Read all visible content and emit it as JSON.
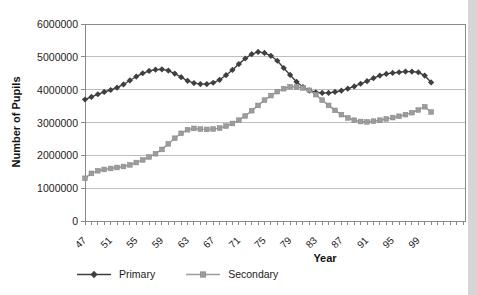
{
  "chart_data": {
    "type": "line",
    "title": "",
    "xlabel": "Year",
    "ylabel": "Number of Pupils",
    "ylim": [
      0,
      6000000
    ],
    "y_tick_interval": 1000000,
    "y_tick_labels": [
      "6000000",
      "5000000",
      "4000000",
      "3000000",
      "2000000",
      "1000000",
      "0"
    ],
    "x_tick_labels": [
      "47",
      "51",
      "55",
      "59",
      "63",
      "67",
      "71",
      "75",
      "79",
      "83",
      "87",
      "91",
      "95",
      "99"
    ],
    "x_label_every": 4,
    "grid": "horizontal",
    "legend_position": "bottom",
    "x": [
      1947,
      1948,
      1949,
      1950,
      1951,
      1952,
      1953,
      1954,
      1955,
      1956,
      1957,
      1958,
      1959,
      1960,
      1961,
      1962,
      1963,
      1964,
      1965,
      1966,
      1967,
      1968,
      1969,
      1970,
      1971,
      1972,
      1973,
      1974,
      1975,
      1976,
      1977,
      1978,
      1979,
      1980,
      1981,
      1982,
      1983,
      1984,
      1985,
      1986,
      1987,
      1988,
      1989,
      1990,
      1991,
      1992,
      1993,
      1994,
      1995,
      1996,
      1997,
      1998,
      1999,
      2000,
      2001
    ],
    "series": [
      {
        "name": "Primary",
        "marker": "diamond",
        "color": "#3f3f3f",
        "values": [
          3700000,
          3780000,
          3860000,
          3930000,
          3990000,
          4060000,
          4160000,
          4280000,
          4400000,
          4500000,
          4570000,
          4610000,
          4620000,
          4580000,
          4490000,
          4380000,
          4270000,
          4200000,
          4170000,
          4170000,
          4210000,
          4300000,
          4440000,
          4600000,
          4780000,
          4950000,
          5080000,
          5150000,
          5120000,
          5030000,
          4880000,
          4660000,
          4450000,
          4240000,
          4080000,
          3970000,
          3920000,
          3900000,
          3900000,
          3930000,
          3970000,
          4030000,
          4100000,
          4180000,
          4260000,
          4350000,
          4430000,
          4480000,
          4510000,
          4530000,
          4550000,
          4550000,
          4530000,
          4430000,
          4220000
        ]
      },
      {
        "name": "Secondary",
        "marker": "square",
        "color": "#9c9c9c",
        "values": [
          1300000,
          1450000,
          1530000,
          1570000,
          1600000,
          1630000,
          1660000,
          1710000,
          1780000,
          1860000,
          1950000,
          2050000,
          2180000,
          2350000,
          2520000,
          2670000,
          2780000,
          2820000,
          2800000,
          2790000,
          2800000,
          2830000,
          2890000,
          2970000,
          3070000,
          3200000,
          3360000,
          3520000,
          3680000,
          3820000,
          3940000,
          4030000,
          4090000,
          4080000,
          4050000,
          3980000,
          3850000,
          3680000,
          3520000,
          3370000,
          3240000,
          3140000,
          3070000,
          3030000,
          3020000,
          3040000,
          3070000,
          3110000,
          3150000,
          3190000,
          3240000,
          3300000,
          3380000,
          3480000,
          3320000
        ]
      }
    ],
    "colors": {
      "primary_series": "#3f3f3f",
      "secondary_series": "#9c9c9c",
      "gridline": "#bdbdbd",
      "plot_border": "#8a8a8a",
      "text": "#1c1c1c"
    }
  }
}
